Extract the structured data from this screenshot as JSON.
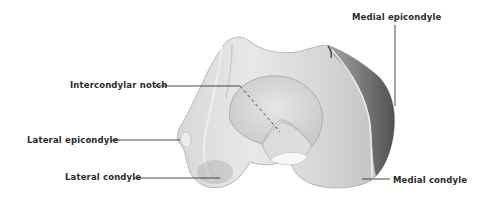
{
  "figure": {
    "colors": {
      "background": "#ffffff",
      "bone_light": "#e4e4e4",
      "bone_mid": "#c8c8c8",
      "bone_dark": "#5a5a5a",
      "leader_line": "#333333",
      "label_text": "#2a2a2a"
    },
    "labels": [
      {
        "id": "intercondylar-notch",
        "text": "Intercondylar notch"
      },
      {
        "id": "medial-epicondyle",
        "text": "Medial epicondyle"
      },
      {
        "id": "lateral-epicondyle",
        "text": "Lateral epicondyle"
      },
      {
        "id": "lateral-condyle",
        "text": "Lateral condyle"
      },
      {
        "id": "medial-condyle",
        "text": "Medial condyle"
      }
    ]
  }
}
